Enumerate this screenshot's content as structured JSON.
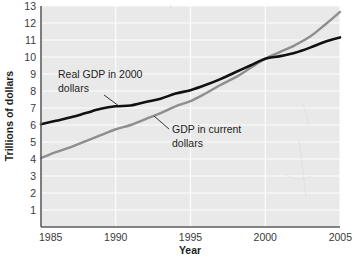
{
  "chart_data": {
    "type": "line",
    "title": "",
    "xlabel": "Year",
    "ylabel": "Trillions of dollars",
    "xlim": [
      1985,
      2005
    ],
    "ylim": [
      0,
      13
    ],
    "xticks": [
      "1985",
      "1990",
      "1995",
      "2000",
      "2005"
    ],
    "xtick_values": [
      1985,
      1990,
      1995,
      2000,
      2005
    ],
    "yticks": [
      "1",
      "2",
      "3",
      "4",
      "5",
      "6",
      "7",
      "8",
      "9",
      "10",
      "11",
      "12",
      "13"
    ],
    "ytick_values": [
      1,
      2,
      3,
      4,
      5,
      6,
      7,
      8,
      9,
      10,
      11,
      12,
      13
    ],
    "grid": "horizontal-and-vertical-white",
    "legend_position": "inline-annotations",
    "plot_background": "#e9e9e9",
    "series": [
      {
        "name": "Real GDP in 2000 dollars",
        "color": "#111111",
        "x": [
          1985,
          1986,
          1987,
          1988,
          1989,
          1990,
          1991,
          1992,
          1993,
          1994,
          1995,
          1996,
          1997,
          1998,
          1999,
          2000,
          2001,
          2002,
          2003,
          2004,
          2005
        ],
        "values": [
          6.05,
          6.25,
          6.45,
          6.7,
          6.95,
          7.1,
          7.15,
          7.35,
          7.55,
          7.85,
          8.05,
          8.35,
          8.7,
          9.1,
          9.5,
          9.9,
          10.05,
          10.25,
          10.55,
          10.9,
          11.15
        ]
      },
      {
        "name": "GDP in current dollars",
        "color": "#8e8e8e",
        "x": [
          1985,
          1986,
          1987,
          1988,
          1989,
          1990,
          1991,
          1992,
          1993,
          1994,
          1995,
          1996,
          1997,
          1998,
          1999,
          2000,
          2001,
          2002,
          2003,
          2004,
          2005
        ],
        "values": [
          4.05,
          4.4,
          4.7,
          5.05,
          5.4,
          5.75,
          6.0,
          6.35,
          6.7,
          7.1,
          7.4,
          7.85,
          8.35,
          8.8,
          9.35,
          9.9,
          10.3,
          10.7,
          11.2,
          11.9,
          12.65
        ]
      }
    ],
    "annotations": [
      {
        "id": "real-gdp-annotation",
        "text_line1": "Real GDP in 2000",
        "text_line2": "dollars",
        "leader_from": {
          "x": 104,
          "y": 92
        },
        "leader_to": {
          "x": 118,
          "y": 103
        }
      },
      {
        "id": "current-gdp-annotation",
        "text_line1": "GDP in current",
        "text_line2": "dollars",
        "leader_from": {
          "x": 170,
          "y": 128
        },
        "leader_to": {
          "x": 155,
          "y": 117
        }
      }
    ]
  },
  "colors": {
    "real_gdp_line": "#111111",
    "current_gdp_line": "#8e8e8e",
    "plot_bg": "#e9e9e9",
    "gridline": "#fdfdfd",
    "axis": "#5d5d5d",
    "page_bg": "#ffffff"
  }
}
